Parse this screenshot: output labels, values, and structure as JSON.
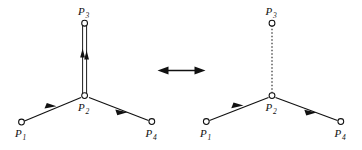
{
  "figure": {
    "relation_symbol": "double-headed-arrow",
    "panels": [
      {
        "id": "left",
        "name": "double-bond-form",
        "vertical_edge_style": "double-line",
        "vertical_edge_has_arrowheads": true,
        "vertical_edge_arrow_direction": "up",
        "nodes": [
          {
            "id": "p1",
            "label": "P",
            "subscript": "1",
            "x": 21,
            "y": 123
          },
          {
            "id": "p2",
            "label": "P",
            "subscript": "2",
            "x": 85,
            "y": 97
          },
          {
            "id": "p3",
            "label": "P",
            "subscript": "3",
            "x": 85,
            "y": 22
          },
          {
            "id": "p4",
            "label": "P",
            "subscript": "4",
            "x": 152,
            "y": 122
          }
        ],
        "edges": [
          {
            "from": "p1",
            "to": "p2",
            "style": "solid",
            "arrow": "toward-p2"
          },
          {
            "from": "p2",
            "to": "p3",
            "style": "double",
            "arrow": "up"
          },
          {
            "from": "p2",
            "to": "p4",
            "style": "solid",
            "arrow": "toward-p4"
          }
        ]
      },
      {
        "id": "right",
        "name": "dotted-bond-form",
        "vertical_edge_style": "dotted-line",
        "vertical_edge_has_arrowheads": false,
        "vertical_edge_arrow_direction": "none",
        "nodes": [
          {
            "id": "p1",
            "label": "P",
            "subscript": "1",
            "x": 206,
            "y": 122
          },
          {
            "id": "p2",
            "label": "P",
            "subscript": "2",
            "x": 272,
            "y": 97
          },
          {
            "id": "p3",
            "label": "P",
            "subscript": "3",
            "x": 272,
            "y": 22
          },
          {
            "id": "p4",
            "label": "P",
            "subscript": "4",
            "x": 341,
            "y": 122
          }
        ],
        "edges": [
          {
            "from": "p1",
            "to": "p2",
            "style": "solid",
            "arrow": "toward-p2"
          },
          {
            "from": "p2",
            "to": "p3",
            "style": "dotted",
            "arrow": "none"
          },
          {
            "from": "p2",
            "to": "p4",
            "style": "solid",
            "arrow": "toward-p4"
          }
        ]
      }
    ],
    "labels": {
      "p1": "P",
      "p2": "P",
      "p3": "P",
      "p4": "P",
      "sub1": "1",
      "sub2": "2",
      "sub3": "3",
      "sub4": "4"
    },
    "colors": {
      "ink": "#111111",
      "background": "#ffffff"
    }
  }
}
